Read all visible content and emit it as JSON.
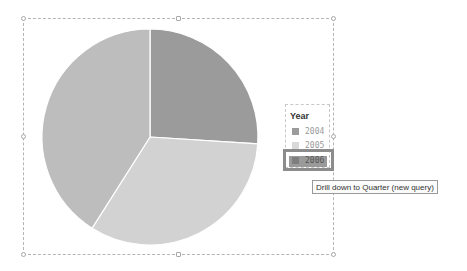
{
  "chart_data": {
    "type": "pie",
    "title": "",
    "legend_title": "Year",
    "legend_position": "right",
    "categories": [
      "2004",
      "2005",
      "2006"
    ],
    "values": [
      26,
      33,
      41
    ],
    "colors": [
      "#9b9b9b",
      "#d2d2d2",
      "#bdbdbd"
    ],
    "start_angle_deg": 0,
    "direction": "clockwise"
  },
  "legend": {
    "title": "Year",
    "items": [
      {
        "label": "2004",
        "color": "#9b9b9b"
      },
      {
        "label": "2005",
        "color": "#d9d9d9"
      },
      {
        "label": "2006",
        "color": "#7e7e7e"
      }
    ],
    "highlighted_index": 2
  },
  "tooltip": {
    "text": "Drill down to Quarter (new query)"
  }
}
